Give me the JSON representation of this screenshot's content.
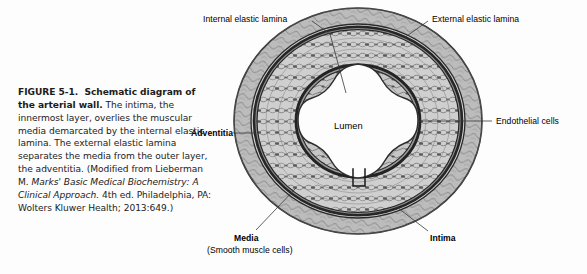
{
  "figure": {
    "number": "FIGURE 5-1.",
    "title": "Schematic diagram of the arterial wall.",
    "body_1": " The intima, the innermost layer, overlies the muscular media demarcated by the internal elastic lamina. The external elastic lamina separates the media from the outer layer, the adventitia. (Modified from Lieberman M. ",
    "source_italic": "Marks' Basic Medical Biochemistry: A Clinical Approach.",
    "body_2": " 4th ed. Philadelphia, PA: Wolters Kluwer Health; 2013:649.)"
  },
  "diagram": {
    "name": "arterial-wall-cross-section",
    "center_label": "Lumen",
    "labels": {
      "internal_elastic_lamina": "Internal elastic lamina",
      "external_elastic_lamina": "External elastic lamina",
      "endothelial_cells": "Endothelial cells",
      "adventitia": "Adventitia",
      "media": "Media",
      "media_sub": "(Smooth muscle cells)",
      "intima": "Intima"
    },
    "layers": [
      {
        "id": "adventitia",
        "label": "Adventitia",
        "fill": "#b9b9b9"
      },
      {
        "id": "external-elastic-lamina",
        "label": "External elastic lamina",
        "fill": "#4a4a4a"
      },
      {
        "id": "media",
        "label": "Media",
        "fill": "#cfcfcf"
      },
      {
        "id": "internal-elastic-lamina",
        "label": "Internal elastic lamina",
        "fill": "#4a4a4a"
      },
      {
        "id": "intima",
        "label": "Intima",
        "fill": "#c4c4c4"
      },
      {
        "id": "lumen",
        "label": "Lumen",
        "fill": "#fcfcfc"
      }
    ],
    "colors": {
      "outline": "#2b2b2b",
      "lamina": "#3d3d3d",
      "media_fill": "#cdcdcd",
      "adventitia_fill": "#bdbdbd",
      "lumen_fill": "#fdfdfd",
      "leader": "#3a3a3a",
      "text": "#000000"
    }
  }
}
